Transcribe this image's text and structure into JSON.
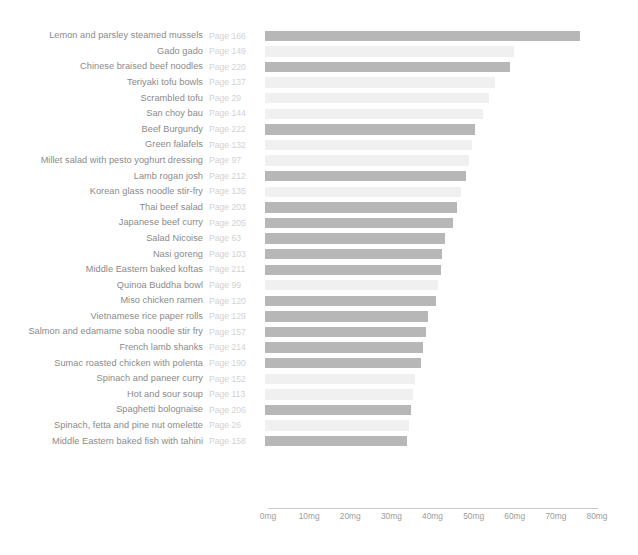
{
  "chart_data": {
    "type": "bar",
    "orientation": "horizontal",
    "title": "",
    "xlabel": "",
    "ylabel": "",
    "xlim": [
      0,
      80
    ],
    "unit": "mg",
    "grid": false,
    "legend": null,
    "xticks": [
      {
        "value": 0,
        "label": "0mg"
      },
      {
        "value": 10,
        "label": "10mg"
      },
      {
        "value": 20,
        "label": "20mg"
      },
      {
        "value": 30,
        "label": "30mg"
      },
      {
        "value": 40,
        "label": "40mg"
      },
      {
        "value": 50,
        "label": "50mg"
      },
      {
        "value": 60,
        "label": "60mg"
      },
      {
        "value": 70,
        "label": "70mg"
      },
      {
        "value": 80,
        "label": "80mg"
      }
    ],
    "categories": [
      "Lemon and parsley steamed mussels",
      "Gado gado",
      "Chinese braised beef noodles",
      "Teriyaki tofu bowls",
      "Scrambled tofu",
      "San choy bau",
      "Beef Burgundy",
      "Green falafels",
      "Millet salad with pesto yoghurt dressing",
      "Lamb rogan josh",
      "Korean glass noodle stir-fry",
      "Thai beef salad",
      "Japanese beef curry",
      "Salad Nicoise",
      "Nasi goreng",
      "Middle Eastern baked koftas",
      "Quinoa Buddha bowl",
      "Miso chicken ramen",
      "Vietnamese rice paper rolls",
      "Salmon and edamame soba noodle stir fry",
      "French lamb shanks",
      "Sumac roasted chicken with polenta",
      "Spinach and paneer curry",
      "Hot and sour soup",
      "Spaghetti bolognaise",
      "Spinach, fetta and pine nut omelette",
      "Middle Eastern baked fish with tahini"
    ],
    "pages": [
      "Page 166",
      "Page 149",
      "Page 220",
      "Page 137",
      "Page 29",
      "Page 144",
      "Page 222",
      "Page 132",
      "Page 97",
      "Page 212",
      "Page 135",
      "Page 203",
      "Page 205",
      "Page 63",
      "Page 103",
      "Page 211",
      "Page 99",
      "Page 120",
      "Page 129",
      "Page 157",
      "Page 214",
      "Page 190",
      "Page 152",
      "Page 113",
      "Page 206",
      "Page 26",
      "Page 158"
    ],
    "values": [
      76.6,
      60.6,
      59.6,
      55.9,
      54.5,
      53.0,
      51.1,
      50.4,
      49.6,
      48.9,
      47.7,
      46.7,
      45.8,
      43.8,
      43.1,
      42.8,
      42.1,
      41.6,
      39.6,
      39.1,
      38.5,
      37.9,
      36.5,
      36.0,
      35.5,
      35.0,
      34.5
    ],
    "bar_colors": [
      "#b7b7b7",
      "#f0f0f0",
      "#b7b7b7",
      "#f0f0f0",
      "#f0f0f0",
      "#f0f0f0",
      "#b7b7b7",
      "#f0f0f0",
      "#f0f0f0",
      "#b7b7b7",
      "#f0f0f0",
      "#b7b7b7",
      "#b7b7b7",
      "#b7b7b7",
      "#b7b7b7",
      "#b7b7b7",
      "#f0f0f0",
      "#b7b7b7",
      "#b7b7b7",
      "#b7b7b7",
      "#b7b7b7",
      "#b7b7b7",
      "#f0f0f0",
      "#f0f0f0",
      "#b7b7b7",
      "#f0f0f0",
      "#b7b7b7"
    ],
    "colors": {
      "highlight": "#b7b7b7",
      "muted": "#f0f0f0",
      "label_text": "#8a8a8a",
      "page_text": "#d2d2d2",
      "tick_text": "#9d9d9d",
      "axis_line": "#c9c9c9",
      "background": "#ffffff"
    }
  }
}
